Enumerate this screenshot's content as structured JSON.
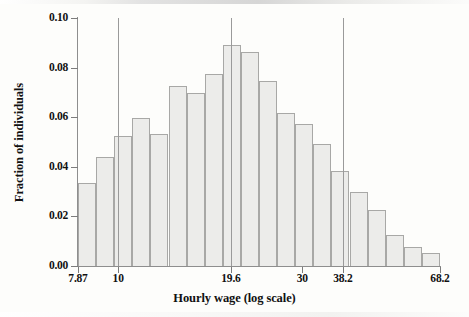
{
  "chart_data": {
    "type": "bar",
    "title": "",
    "xlabel": "Hourly wage (log scale)",
    "ylabel": "Fraction of individuals",
    "ylim": [
      0.0,
      0.1
    ],
    "ytick_labels": [
      "0.00",
      "0.02",
      "0.04",
      "0.06",
      "0.08",
      "0.10"
    ],
    "ytick_values": [
      0.0,
      0.02,
      0.04,
      0.06,
      0.08,
      0.1
    ],
    "xtick_labels": [
      "7.87",
      "10",
      "19.6",
      "30",
      "38.2",
      "68.2"
    ],
    "xtick_values": [
      7.87,
      10,
      19.6,
      30,
      38.2,
      68.2
    ],
    "xscale": "log",
    "grid": false,
    "legend": null,
    "reference_lines": [
      {
        "label": "10",
        "value": 10
      },
      {
        "label": "19.6",
        "value": 19.6
      },
      {
        "label": "38.2",
        "value": 38.2
      }
    ],
    "bar_edge_color": "#a8a8a6",
    "bar_fill_color": "#ececea",
    "categories": [
      "7.87",
      "8.78",
      "9.80",
      "10.93",
      "12.20",
      "13.61",
      "15.19",
      "16.95",
      "18.91",
      "21.10",
      "23.54",
      "26.27",
      "29.31",
      "32.70",
      "36.49",
      "40.71",
      "45.42"
    ],
    "values": [
      0.0333,
      0.044,
      0.0524,
      0.0596,
      0.0533,
      0.0727,
      0.0699,
      0.0776,
      0.089,
      0.0862,
      0.0748,
      0.0615,
      0.0572,
      0.0491,
      0.0385,
      0.0297,
      0.0227
    ],
    "tail_values": [
      0.0124,
      0.0076,
      0.0053
    ],
    "bars": [
      {
        "category": "7.87",
        "value": 0.0333
      },
      {
        "category": "8.78",
        "value": 0.044
      },
      {
        "category": "9.80",
        "value": 0.0524
      },
      {
        "category": "10.93",
        "value": 0.0596
      },
      {
        "category": "12.20",
        "value": 0.0533
      },
      {
        "category": "13.61",
        "value": 0.0727
      },
      {
        "category": "15.19",
        "value": 0.0699
      },
      {
        "category": "16.95",
        "value": 0.0776
      },
      {
        "category": "18.91",
        "value": 0.089
      },
      {
        "category": "21.10",
        "value": 0.0862
      },
      {
        "category": "23.54",
        "value": 0.0748
      },
      {
        "category": "26.27",
        "value": 0.0615
      },
      {
        "category": "29.31",
        "value": 0.0572
      },
      {
        "category": "32.70",
        "value": 0.0491
      },
      {
        "category": "36.49",
        "value": 0.0385
      },
      {
        "category": "40.71",
        "value": 0.0297
      },
      {
        "category": "45.42",
        "value": 0.0227
      },
      {
        "category": "50.69",
        "value": 0.0124
      },
      {
        "category": "56.57",
        "value": 0.0076
      },
      {
        "category": "63.14",
        "value": 0.0053
      }
    ]
  },
  "axes": {
    "y_title": "Fraction of individuals",
    "x_title": "Hourly wage (log scale)",
    "y_ticks": [
      {
        "label": "0.10",
        "value": 0.1
      },
      {
        "label": "0.08",
        "value": 0.08
      },
      {
        "label": "0.06",
        "value": 0.06
      },
      {
        "label": "0.04",
        "value": 0.04
      },
      {
        "label": "0.02",
        "value": 0.02
      },
      {
        "label": "0.00",
        "value": 0.0
      }
    ],
    "x_ticks": [
      {
        "label": "7.87",
        "value": 7.87
      },
      {
        "label": "10",
        "value": 10
      },
      {
        "label": "19.6",
        "value": 19.6
      },
      {
        "label": "30",
        "value": 30
      },
      {
        "label": "38.2",
        "value": 38.2
      },
      {
        "label": "68.2",
        "value": 68.2
      }
    ]
  }
}
